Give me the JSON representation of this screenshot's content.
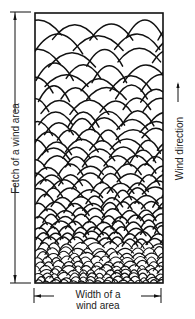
{
  "diagram": {
    "type": "wind-wave fetch diagram",
    "labels": {
      "fetch": "Fetch of a wind area",
      "wind_direction": "Wind direction",
      "width_line1": "Width of a",
      "width_line2": "wind area"
    },
    "icons": {
      "fetch_arrow": "double-headed-vertical-arrow",
      "wind_arrow": "up-arrow",
      "width_arrow": "double-headed-horizontal-arrow"
    },
    "colors": {
      "stroke": "#111111",
      "background": "#ffffff",
      "text": "#222222"
    },
    "box": {
      "x": 35,
      "y": 13,
      "width": 128,
      "height": 270
    }
  }
}
